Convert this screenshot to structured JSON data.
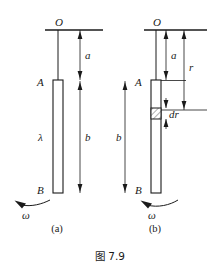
{
  "figure": {
    "caption": "图 7.9",
    "caption_number": "7.9",
    "background_color": "#ffffff",
    "line_color": "#1a1a1a",
    "panels": [
      {
        "id": "a",
        "label": "(a)",
        "pivot_label": "O",
        "rod_top_label": "A",
        "rod_bottom_label": "B",
        "density_label": "λ",
        "dim_a_label": "a",
        "dim_b_label": "b",
        "omega_label": "ω"
      },
      {
        "id": "b",
        "label": "(b)",
        "pivot_label": "O",
        "rod_top_label": "A",
        "rod_bottom_label": "B",
        "dim_a_label": "a",
        "dim_b_label": "b",
        "dim_r_label": "r",
        "element_label": "dr",
        "omega_label": "ω"
      }
    ]
  }
}
